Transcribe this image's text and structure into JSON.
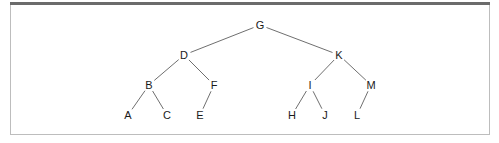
{
  "diagram": {
    "type": "binary-tree",
    "colors": {
      "edge": "#6f6f6f",
      "label": "#1a1a1a",
      "frame_top": "#6b6b6b",
      "frame_border": "#bdbdbd"
    },
    "nodes": [
      {
        "id": "G",
        "label": "G",
        "x": 260,
        "y": 25
      },
      {
        "id": "D",
        "label": "D",
        "x": 184,
        "y": 55
      },
      {
        "id": "K",
        "label": "K",
        "x": 339,
        "y": 55
      },
      {
        "id": "B",
        "label": "B",
        "x": 149,
        "y": 85
      },
      {
        "id": "F",
        "label": "F",
        "x": 214,
        "y": 85
      },
      {
        "id": "I",
        "label": "I",
        "x": 310,
        "y": 85
      },
      {
        "id": "M",
        "label": "M",
        "x": 371,
        "y": 85
      },
      {
        "id": "A",
        "label": "A",
        "x": 128,
        "y": 115
      },
      {
        "id": "C",
        "label": "C",
        "x": 167,
        "y": 115
      },
      {
        "id": "E",
        "label": "E",
        "x": 200,
        "y": 115
      },
      {
        "id": "H",
        "label": "H",
        "x": 292,
        "y": 115
      },
      {
        "id": "J",
        "label": "J",
        "x": 325,
        "y": 115
      },
      {
        "id": "L",
        "label": "L",
        "x": 357,
        "y": 115
      }
    ],
    "edges": [
      [
        "G",
        "D"
      ],
      [
        "G",
        "K"
      ],
      [
        "D",
        "B"
      ],
      [
        "D",
        "F"
      ],
      [
        "K",
        "I"
      ],
      [
        "K",
        "M"
      ],
      [
        "B",
        "A"
      ],
      [
        "B",
        "C"
      ],
      [
        "F",
        "E"
      ],
      [
        "I",
        "H"
      ],
      [
        "I",
        "J"
      ],
      [
        "M",
        "L"
      ]
    ]
  }
}
